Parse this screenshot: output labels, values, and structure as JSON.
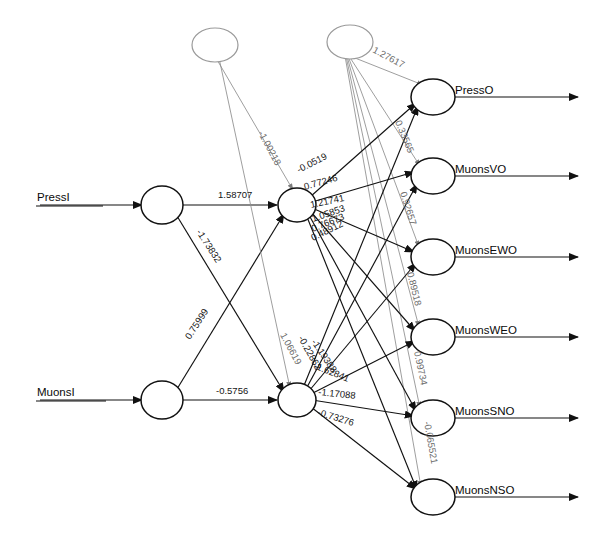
{
  "diagram": {
    "type": "neural-network",
    "title": "",
    "input_layer": {
      "nodes": [
        {
          "id": "PressI",
          "label": "PressI",
          "cx": 162,
          "cy": 205
        },
        {
          "id": "MuonsI",
          "label": "MuonsI",
          "cx": 162,
          "cy": 400
        }
      ]
    },
    "bias_layer": {
      "nodes": [
        {
          "id": "bias1",
          "label": "",
          "cx": 215,
          "cy": 45
        },
        {
          "id": "bias2",
          "label": "",
          "cx": 350,
          "cy": 42
        }
      ]
    },
    "hidden_layer": {
      "nodes": [
        {
          "id": "H1",
          "label": "",
          "cx": 297,
          "cy": 205
        },
        {
          "id": "H2",
          "label": "",
          "cx": 297,
          "cy": 400
        }
      ]
    },
    "output_layer": {
      "nodes": [
        {
          "id": "PressO",
          "label": "PressO",
          "cx": 433,
          "cy": 97
        },
        {
          "id": "MuonsVO",
          "label": "MuonsVO",
          "cx": 433,
          "cy": 176
        },
        {
          "id": "MuonsEWO",
          "label": "MuonsEWO",
          "cx": 433,
          "cy": 257
        },
        {
          "id": "MuonsWEO",
          "label": "MuonsWEO",
          "cx": 433,
          "cy": 337
        },
        {
          "id": "MuonsSNO",
          "label": "MuonsSNO",
          "cx": 433,
          "cy": 418
        },
        {
          "id": "MuonsNSO",
          "label": "MuonsNSO",
          "cx": 433,
          "cy": 497
        }
      ]
    },
    "weights": [
      {
        "id": "w_pressI_h1",
        "value": "1.58707",
        "x": 218,
        "y": 198,
        "rot": 0,
        "faint": false
      },
      {
        "id": "w_pressI_h2",
        "value": "-1.73832",
        "x": 196,
        "y": 232,
        "rot": 57,
        "faint": false
      },
      {
        "id": "w_muonsI_h1",
        "value": "0.75999",
        "x": 190,
        "y": 340,
        "rot": -57,
        "faint": false
      },
      {
        "id": "w_muonsI_h2",
        "value": "-0.5756",
        "x": 216,
        "y": 394,
        "rot": 0,
        "faint": false
      },
      {
        "id": "w_bias1_h1",
        "value": "-1.00218",
        "x": 258,
        "y": 133,
        "rot": 62,
        "faint": true
      },
      {
        "id": "w_bias2_press",
        "value": "1.27617",
        "x": 372,
        "y": 52,
        "rot": 28,
        "faint": true
      },
      {
        "id": "w_h1_o1",
        "value": "-0.0519",
        "x": 299,
        "y": 173,
        "rot": -27,
        "faint": false
      },
      {
        "id": "w_h1_o2",
        "value": "0.77246",
        "x": 305,
        "y": 190,
        "rot": -16,
        "faint": false
      },
      {
        "id": "w_h1_o3",
        "value": "1.21741",
        "x": 311,
        "y": 208,
        "rot": -12,
        "faint": false
      },
      {
        "id": "w_h1_o4",
        "value": "1.05853",
        "x": 313,
        "y": 222,
        "rot": -19,
        "faint": false
      },
      {
        "id": "w_h1_o5",
        "value": "0.76673",
        "x": 313,
        "y": 232,
        "rot": -22,
        "faint": false
      },
      {
        "id": "w_h1_o6",
        "value": "0.48912",
        "x": 313,
        "y": 241,
        "rot": -26,
        "faint": false
      },
      {
        "id": "w_h2_o1",
        "value": "1.06619",
        "x": 280,
        "y": 335,
        "rot": 62,
        "faint": true
      },
      {
        "id": "w_h2_o2",
        "value": "-0.22862",
        "x": 298,
        "y": 338,
        "rot": 61,
        "faint": false
      },
      {
        "id": "w_h2_o3",
        "value": "-1.19388",
        "x": 311,
        "y": 342,
        "rot": 56,
        "faint": false
      },
      {
        "id": "w_h2_o4",
        "value": "-1.62841",
        "x": 313,
        "y": 368,
        "rot": 22,
        "faint": false
      },
      {
        "id": "w_h2_o5",
        "value": "-1.17088",
        "x": 318,
        "y": 395,
        "rot": 6,
        "faint": false
      },
      {
        "id": "w_h2_o6",
        "value": "-0.73276",
        "x": 317,
        "y": 415,
        "rot": 17,
        "faint": false
      },
      {
        "id": "w_b2_muonsvo",
        "value": "0.33565",
        "x": 395,
        "y": 122,
        "rot": 67,
        "faint": true
      },
      {
        "id": "w_b2_muonsewo",
        "value": "0.92657",
        "x": 400,
        "y": 193,
        "rot": 72,
        "faint": true
      },
      {
        "id": "w_b2_muonsweo",
        "value": "0.89518",
        "x": 407,
        "y": 273,
        "rot": 76,
        "faint": true
      },
      {
        "id": "w_b2_muonssno",
        "value": "0.99734",
        "x": 414,
        "y": 352,
        "rot": 78,
        "faint": true
      },
      {
        "id": "w_b2_muonsnso",
        "value": "-0.065521",
        "x": 424,
        "y": 422,
        "rot": 80,
        "faint": true
      }
    ]
  }
}
